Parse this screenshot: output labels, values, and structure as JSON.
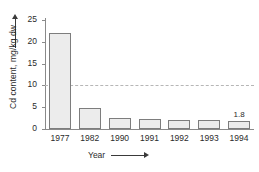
{
  "chart_data": {
    "type": "bar",
    "title": "",
    "xlabel": "Year",
    "ylabel": "Cd content, mg/kg dw",
    "categories": [
      "1977",
      "1982",
      "1990",
      "1991",
      "1992",
      "1993",
      "1994"
    ],
    "values": [
      22.0,
      4.8,
      2.6,
      2.3,
      2.1,
      2.0,
      1.8
    ],
    "ylim": [
      0,
      25
    ],
    "yticks": [
      0,
      5,
      10,
      15,
      20,
      25
    ],
    "ytick_labels": [
      "0",
      "5",
      "10",
      "15",
      "20",
      "25"
    ],
    "grid": false,
    "legend": null,
    "annotations": [
      {
        "category": "1994",
        "value": 1.8,
        "text": "1.8"
      }
    ],
    "reference_line": {
      "value": 10,
      "style": "dashed",
      "color": "#b6b6b6"
    },
    "bar_fill": "#ececec",
    "bar_edge": "#7d7d7d",
    "axis_color": "#8a8a8a",
    "text_color": "#2b2b2b",
    "xlabel_arrow": "arrow-right",
    "ylabel_arrow": "arrow-up"
  }
}
